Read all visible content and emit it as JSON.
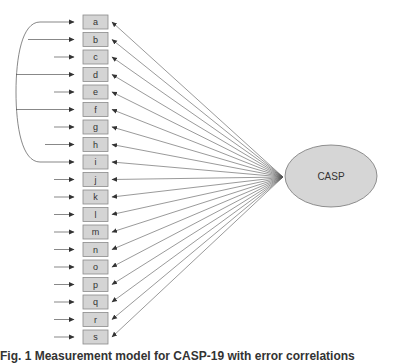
{
  "diagram": {
    "type": "measurement-model",
    "factor": {
      "label": "CASP",
      "fill": "#d6d6d6",
      "stroke": "#777777"
    },
    "indicators": [
      "a",
      "b",
      "c",
      "d",
      "e",
      "f",
      "g",
      "h",
      "i",
      "j",
      "k",
      "l",
      "m",
      "n",
      "o",
      "p",
      "q",
      "r",
      "s"
    ],
    "indicator_fill": "#d4d4d4",
    "indicator_stroke": "#8a8a8a",
    "line_color": "#555555",
    "correlated_errors": [
      "a",
      "b",
      "d",
      "f",
      "i"
    ]
  },
  "caption": "Fig. 1 Measurement model for CASP-19 with error correlations"
}
